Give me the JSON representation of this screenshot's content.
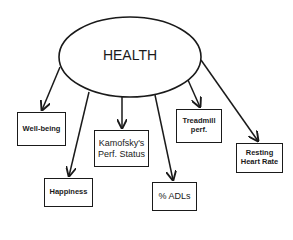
{
  "diagram": {
    "root": {
      "label": "HEALTH"
    },
    "nodes": [
      {
        "id": "well-being",
        "label": "Well-being"
      },
      {
        "id": "happiness",
        "label": "Happiness"
      },
      {
        "id": "karnofsky",
        "label_line1": "Kamofsky's",
        "label_line2": "Perf. Status"
      },
      {
        "id": "adls",
        "label": "% ADLs"
      },
      {
        "id": "treadmill",
        "label_line1": "Treadmill",
        "label_line2": "perf."
      },
      {
        "id": "resting-hr",
        "label_line1": "Resting",
        "label_line2": "Heart Rate"
      }
    ],
    "edges": [
      {
        "from": "HEALTH",
        "to": "Well-being"
      },
      {
        "from": "HEALTH",
        "to": "Happiness"
      },
      {
        "from": "HEALTH",
        "to": "Kamofsky's Perf. Status"
      },
      {
        "from": "HEALTH",
        "to": "% ADLs"
      },
      {
        "from": "HEALTH",
        "to": "Treadmill perf."
      },
      {
        "from": "HEALTH",
        "to": "Resting Heart Rate"
      }
    ]
  }
}
